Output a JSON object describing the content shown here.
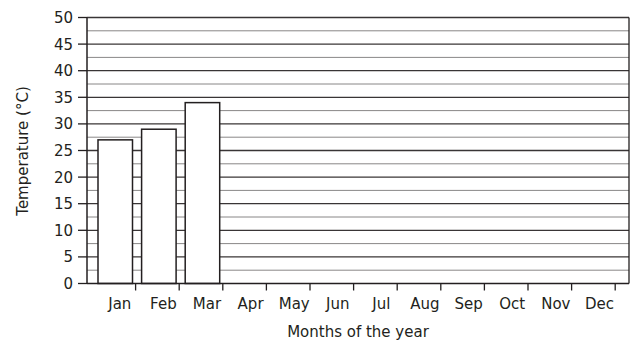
{
  "chart_data": {
    "type": "bar",
    "title": "",
    "xlabel": "Months of the year",
    "ylabel": "Temperature (°C)",
    "categories": [
      "Jan",
      "Feb",
      "Mar",
      "Apr",
      "May",
      "Jun",
      "Jul",
      "Aug",
      "Sep",
      "Oct",
      "Nov",
      "Dec"
    ],
    "values": [
      27,
      29,
      34,
      null,
      null,
      null,
      null,
      null,
      null,
      null,
      null,
      null
    ],
    "ylim": [
      0,
      50
    ],
    "yticks": [
      0,
      5,
      10,
      15,
      20,
      25,
      30,
      35,
      40,
      45,
      50
    ],
    "minor_gridlines_every": 2.5,
    "grid": true,
    "legend": null,
    "colors": {
      "bar_fill": "#ffffff",
      "bar_stroke": "#231f20",
      "grid": "#231f20",
      "axis": "#231f20"
    }
  },
  "labels": {
    "xlabel": "Months of the year",
    "ylabel": "Temperature (°C)"
  }
}
